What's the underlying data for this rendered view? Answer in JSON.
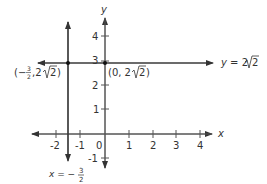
{
  "diagram": {
    "type": "coordinate-plane",
    "axes": {
      "x_label": "x",
      "y_label": "y",
      "x_ticks": [
        "-2",
        "-1",
        "1",
        "2",
        "3",
        "4"
      ],
      "y_ticks": [
        "4",
        "3",
        "2",
        "1",
        "-1"
      ],
      "origin_label": "0"
    },
    "lines": {
      "horizontal": {
        "equation_lhs": "y = 2",
        "equation_radical": "2"
      },
      "vertical": {
        "equation_lhs": "x = −",
        "frac_num": "3",
        "frac_den": "2"
      }
    },
    "points": [
      {
        "label_prefix": "(−",
        "frac_num": "3",
        "frac_den": "2",
        "label_mid": ", 2",
        "radical": "2",
        "label_suffix": ")"
      },
      {
        "label_prefix": "(0, 2",
        "radical": "2",
        "label_suffix": ")"
      }
    ],
    "colors": {
      "line": "#3a3a3a",
      "axis": "#555555",
      "text": "#333333"
    }
  }
}
